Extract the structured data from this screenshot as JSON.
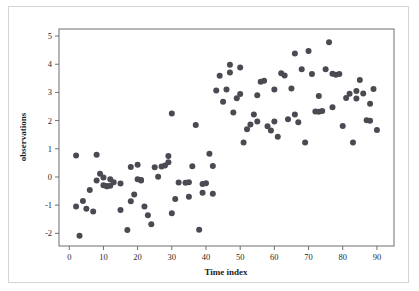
{
  "figure": {
    "background_color": "#ffffff",
    "frame_border_color": "#d4d4d4",
    "plot_border_color": "#6f6f6f",
    "point_color": "#4a4a52"
  },
  "chart_data": {
    "type": "scatter",
    "title": "",
    "xlabel": "Time index",
    "ylabel": "observations",
    "xlim": [
      -3,
      95
    ],
    "ylim": [
      -2.45,
      5.25
    ],
    "xticks": [
      0,
      10,
      20,
      30,
      40,
      50,
      60,
      70,
      80,
      90
    ],
    "xtick_labels": [
      "0",
      "10",
      "20",
      "30",
      "40",
      "50",
      "60",
      "70",
      "80",
      "90"
    ],
    "yticks": [
      -2,
      -1,
      0,
      1,
      2,
      3,
      4,
      5
    ],
    "ytick_labels": [
      "-2",
      "-1",
      "0",
      "1",
      "2",
      "3",
      "4",
      "5"
    ],
    "grid": false,
    "legend": false,
    "marker": "circle",
    "marker_size": 3,
    "series": [
      {
        "name": "observations",
        "x": [
          2,
          2,
          3,
          4,
          5,
          6,
          7,
          8,
          8,
          9,
          10,
          10,
          11,
          11,
          12,
          12,
          13,
          15,
          15,
          17,
          18,
          18,
          19,
          20,
          20,
          21,
          21,
          22,
          23,
          24,
          25,
          26,
          27,
          28,
          29,
          29,
          30,
          30,
          31,
          32,
          34,
          35,
          35,
          36,
          37,
          38,
          39,
          39,
          40,
          41,
          42,
          42,
          43,
          44,
          45,
          46,
          47,
          47,
          48,
          49,
          50,
          50,
          51,
          52,
          53,
          54,
          55,
          55,
          56,
          57,
          58,
          59,
          60,
          60,
          61,
          62,
          63,
          64,
          65,
          66,
          66,
          67,
          68,
          69,
          70,
          71,
          72,
          73,
          73,
          74,
          75,
          76,
          77,
          77,
          78,
          79,
          80,
          81,
          82,
          83,
          84,
          84,
          85,
          86,
          87,
          88,
          88,
          89,
          90
        ],
        "y": [
          0.76,
          -1.05,
          -2.09,
          -0.85,
          -1.13,
          -0.46,
          -1.23,
          -0.13,
          0.79,
          0.11,
          -0.02,
          -0.29,
          -0.33,
          -0.33,
          -0.31,
          -0.08,
          -0.19,
          -0.23,
          -1.17,
          -1.88,
          0.35,
          -0.86,
          -0.62,
          0.43,
          -0.08,
          -0.11,
          -0.13,
          -1.05,
          -1.36,
          -1.68,
          0.34,
          0.01,
          0.37,
          0.41,
          0.52,
          0.74,
          2.25,
          -1.29,
          -0.78,
          -0.2,
          -0.21,
          -0.7,
          -0.19,
          0.38,
          1.84,
          -1.87,
          -0.56,
          -0.25,
          -0.22,
          0.82,
          -0.6,
          0.39,
          3.07,
          3.59,
          2.67,
          3.1,
          3.98,
          3.71,
          2.29,
          2.79,
          3.88,
          2.94,
          1.22,
          1.69,
          1.86,
          2.22,
          2.9,
          1.97,
          3.38,
          3.41,
          1.8,
          1.65,
          1.97,
          3.1,
          1.43,
          3.68,
          3.6,
          2.05,
          3.14,
          4.38,
          2.22,
          1.94,
          3.82,
          1.22,
          4.47,
          3.65,
          2.32,
          2.31,
          2.87,
          2.34,
          3.82,
          4.78,
          2.47,
          3.66,
          3.63,
          3.65,
          1.81,
          2.8,
          2.95,
          1.22,
          3.05,
          2.78,
          3.44,
          2.96,
          2.01,
          2.6,
          1.99,
          3.12,
          1.67
        ]
      }
    ]
  }
}
